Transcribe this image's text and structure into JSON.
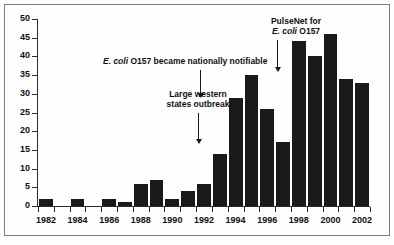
{
  "chart_data": {
    "type": "bar",
    "title": "",
    "subtitle": "",
    "xlabel": "",
    "ylabel": "",
    "ylim": [
      0,
      50
    ],
    "ytick_step": 5,
    "grid": false,
    "legend": "none",
    "categories": [
      "1982",
      "1983",
      "1984",
      "1985",
      "1986",
      "1987",
      "1988",
      "1989",
      "1990",
      "1991",
      "1992",
      "1993",
      "1994",
      "1995",
      "1996",
      "1997",
      "1998",
      "1999",
      "2000",
      "2001",
      "2002"
    ],
    "values": [
      2,
      0,
      2,
      0,
      2,
      1,
      6,
      7,
      2,
      4,
      6,
      14,
      29,
      35,
      26,
      17,
      44,
      40,
      46,
      34,
      33
    ],
    "ytick_labels": [
      "0",
      "5",
      "10",
      "15",
      "20",
      "25",
      "30",
      "35",
      "40",
      "45",
      "50"
    ],
    "xtick_labels": [
      "1982",
      "1984",
      "1986",
      "1988",
      "1990",
      "1992",
      "1994",
      "1996",
      "1998",
      "2000",
      "2002"
    ],
    "xtick_categories": [
      "1982",
      "1984",
      "1986",
      "1988",
      "1990",
      "1992",
      "1994",
      "1996",
      "1998",
      "2000",
      "2002"
    ],
    "bar_color": "#1a1a1a",
    "axis_color": "#2b2b2b",
    "annotations": [
      {
        "id": "notifiable",
        "text_italic": "E. coli",
        "text_rest": " O157 became nationally notifiable",
        "target_category": "1994"
      },
      {
        "id": "western-outbreak",
        "line1": "Large western",
        "line2": "states outbreak",
        "target_category": "1993"
      },
      {
        "id": "pulsenet",
        "line1": "PulseNet for",
        "line2_italic": "E. coli",
        "line2_rest": " O157",
        "target_category": "1997"
      }
    ]
  }
}
